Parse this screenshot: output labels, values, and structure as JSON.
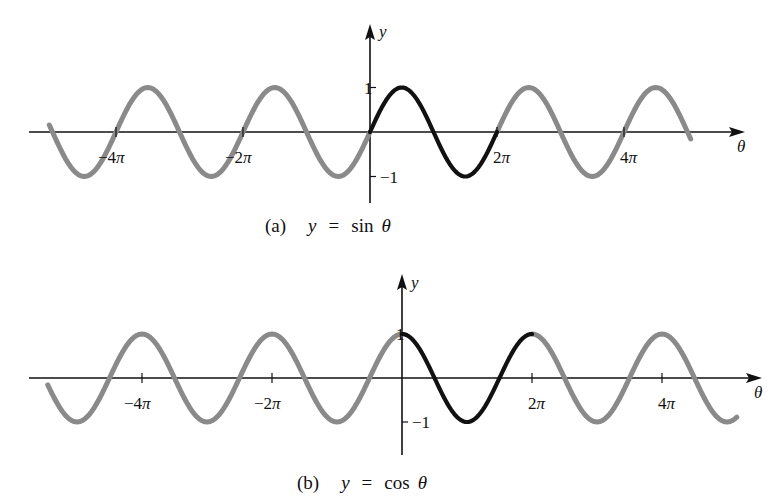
{
  "figure": {
    "background": "#ffffff",
    "colors": {
      "highlight_period": "#111111",
      "other_periods": "#8a8a8a",
      "axes": "#111111"
    }
  },
  "chart_data": [
    {
      "id": "a",
      "type": "line",
      "function": "sin",
      "title": "(a)  y = sin θ",
      "caption_prefix": "(a)",
      "caption_y": "y",
      "caption_eq": "=",
      "caption_fn": "sin",
      "caption_var": "θ",
      "xlabel": "θ",
      "ylabel": "y",
      "x_range": [
        -5.05,
        5.45
      ],
      "x_unit": "π",
      "ylim": [
        -1,
        1
      ],
      "x_ticks": [
        {
          "value": -4,
          "label": "−4π"
        },
        {
          "value": -2,
          "label": "−2π"
        },
        {
          "value": 2,
          "label": "2π"
        },
        {
          "value": 4,
          "label": "4π"
        }
      ],
      "y_ticks": [
        {
          "value": 1,
          "label": "1"
        },
        {
          "value": -1,
          "label": "−1"
        }
      ],
      "highlight_interval": [
        0,
        2
      ],
      "series": [
        {
          "name": "sin θ (one period, 0 to 2π)",
          "style": "black",
          "x_pi": [
            0,
            0.5,
            1,
            1.5,
            2
          ],
          "y": [
            0,
            1,
            0,
            -1,
            0
          ]
        },
        {
          "name": "sin θ (other periods)",
          "style": "gray",
          "x_pi": [
            -5,
            -4.5,
            -4,
            -3.5,
            -3,
            -2.5,
            -2,
            -1.5,
            -1,
            -0.5,
            0,
            2,
            2.5,
            3,
            3.5,
            4,
            4.5,
            5
          ],
          "y": [
            0,
            -1,
            0,
            1,
            0,
            -1,
            0,
            1,
            0,
            -1,
            0,
            0,
            1,
            0,
            -1,
            0,
            1,
            0
          ]
        }
      ],
      "grid": false,
      "legend": "none"
    },
    {
      "id": "b",
      "type": "line",
      "function": "cos",
      "title": "(b)  y = cos θ",
      "caption_prefix": "(b)",
      "caption_y": "y",
      "caption_eq": "=",
      "caption_fn": "cos",
      "caption_var": "θ",
      "xlabel": "θ",
      "ylabel": "y",
      "x_range": [
        -5.45,
        5.2
      ],
      "x_unit": "π",
      "ylim": [
        -1,
        1
      ],
      "x_ticks": [
        {
          "value": -4,
          "label": "−4π"
        },
        {
          "value": -2,
          "label": "−2π"
        },
        {
          "value": 2,
          "label": "2π"
        },
        {
          "value": 4,
          "label": "4π"
        }
      ],
      "y_ticks": [
        {
          "value": 1,
          "label": "1"
        },
        {
          "value": -1,
          "label": "−1"
        }
      ],
      "highlight_interval": [
        0,
        2
      ],
      "series": [
        {
          "name": "cos θ (one period, 0 to 2π)",
          "style": "black",
          "x_pi": [
            0,
            0.5,
            1,
            1.5,
            2
          ],
          "y": [
            1,
            0,
            -1,
            0,
            1
          ]
        },
        {
          "name": "cos θ (other periods)",
          "style": "gray",
          "x_pi": [
            -5.5,
            -5,
            -4.5,
            -4,
            -3.5,
            -3,
            -2.5,
            -2,
            -1.5,
            -1,
            -0.5,
            0,
            2,
            2.5,
            3,
            3.5,
            4,
            4.5,
            5
          ],
          "y": [
            0,
            -1,
            0,
            1,
            0,
            -1,
            0,
            1,
            0,
            -1,
            0,
            1,
            1,
            0,
            -1,
            0,
            1,
            0,
            -1
          ]
        }
      ],
      "grid": false,
      "legend": "none"
    }
  ],
  "layout": {
    "panels": [
      {
        "origin_x": 370,
        "origin_y": 132,
        "px_per_pi": 63.5,
        "amp_px": 44.5,
        "axis_x_start": 29,
        "axis_x_end": 745,
        "axis_y_top": 24,
        "axis_y_bottom": 203,
        "curve_start_pi": -5.05,
        "curve_end_pi": 5.05,
        "end_fade_x": 694,
        "end_fade_y": 150,
        "caption_y": 232,
        "xlabel_pos": [
          737,
          152
        ],
        "ylabel_pos": [
          379,
          37
        ]
      },
      {
        "origin_x": 402,
        "origin_y": 378,
        "px_per_pi": 65,
        "amp_px": 44,
        "axis_x_start": 29,
        "axis_x_end": 762,
        "axis_y_top": 274,
        "axis_y_bottom": 455,
        "curve_start_pi": -5.45,
        "curve_end_pi": 5.15,
        "caption_y": 489,
        "xlabel_pos": [
          754,
          398
        ],
        "ylabel_pos": [
          411,
          288
        ]
      }
    ]
  }
}
